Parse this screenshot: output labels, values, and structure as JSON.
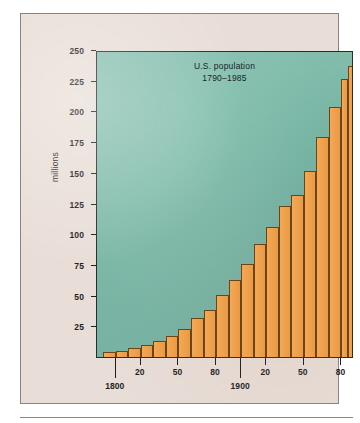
{
  "figure": {
    "title_line1": "U.S. population",
    "title_line2": "1790–1985",
    "y_axis_title": "millions",
    "plot_background_color": "#7cb8a7",
    "bar_color": "#efa04a",
    "panel_color": "#e9ded7",
    "axis_color": "#1d1d1d"
  },
  "chart_data": {
    "type": "bar",
    "title": "U.S. population 1790–1985",
    "xlabel": "",
    "ylabel": "millions",
    "ylim": [
      0,
      250
    ],
    "ytick_labels": [
      "25",
      "50",
      "75",
      "100",
      "125",
      "150",
      "175",
      "200",
      "225",
      "250"
    ],
    "ytick_values": [
      25,
      50,
      75,
      100,
      125,
      150,
      175,
      200,
      225,
      250
    ],
    "xtick_labels": [
      "1800",
      "20",
      "50",
      "80",
      "1900",
      "20",
      "50",
      "80"
    ],
    "xtick_values": [
      1800,
      1820,
      1850,
      1880,
      1900,
      1920,
      1950,
      1980
    ],
    "xlim": [
      1785,
      1990
    ],
    "grid": false,
    "legend": null,
    "categories": [
      "1790",
      "1800",
      "1810",
      "1820",
      "1830",
      "1840",
      "1850",
      "1860",
      "1870",
      "1880",
      "1890",
      "1900",
      "1910",
      "1920",
      "1930",
      "1940",
      "1950",
      "1960",
      "1970",
      "1980",
      "1985"
    ],
    "values": [
      3.9,
      5.3,
      7.2,
      9.6,
      12.9,
      17.1,
      23.2,
      31.4,
      38.6,
      50.2,
      62.9,
      76.0,
      92.0,
      105.7,
      122.8,
      131.7,
      151.3,
      179.3,
      203.3,
      226.5,
      237.0
    ]
  }
}
